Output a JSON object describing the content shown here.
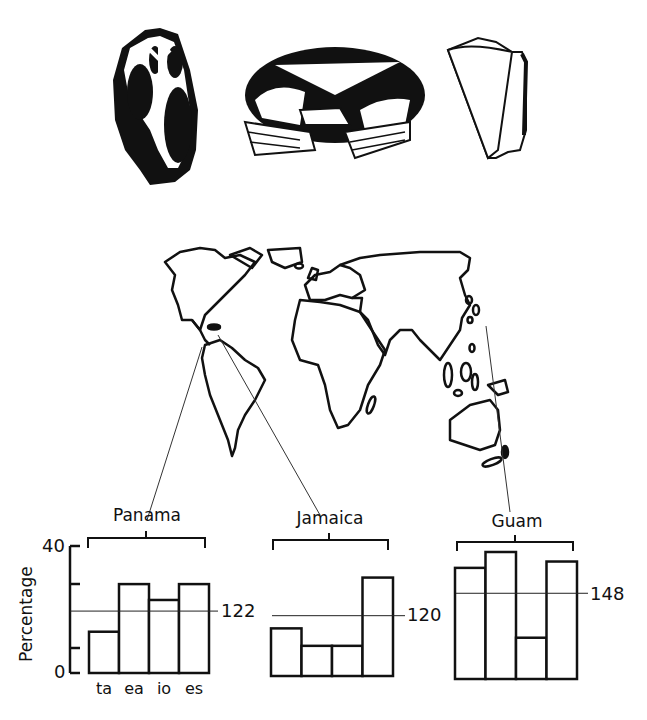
{
  "illustrations": [
    {
      "name": "shell-cross-section",
      "description": "sectioned gastropod shell"
    },
    {
      "name": "crab",
      "description": "crab (dorsal view)"
    },
    {
      "name": "cone-shell",
      "description": "cone shell"
    }
  ],
  "map": {
    "name": "world-map",
    "locations": [
      "Panama",
      "Jamaica",
      "Guam"
    ]
  },
  "axis": {
    "ylabel": "Percentage",
    "y_top": "40",
    "y_bottom": "0"
  },
  "categories": [
    "ta",
    "ea",
    "io",
    "es"
  ],
  "panels": [
    {
      "location": "Panama",
      "mean_label": "122"
    },
    {
      "location": "Jamaica",
      "mean_label": "120"
    },
    {
      "location": "Guam",
      "mean_label": "148"
    }
  ],
  "chart_data": {
    "type": "bar",
    "title": "",
    "xlabel": "",
    "ylabel": "Percentage",
    "ylim": [
      0,
      40
    ],
    "yticks": [
      0,
      10,
      20,
      30,
      40
    ],
    "ytick_labels": [
      "0",
      "",
      "",
      "",
      "40"
    ],
    "grid": false,
    "legend": "none",
    "categories": [
      "ta",
      "ea",
      "io",
      "es"
    ],
    "series": [
      {
        "name": "Panama",
        "values": [
          13,
          28,
          23,
          28
        ],
        "reference_line": 19.5,
        "reference_label": "122"
      },
      {
        "name": "Jamaica",
        "values": [
          15,
          9.5,
          9.5,
          31
        ],
        "reference_line": 19,
        "reference_label": "120"
      },
      {
        "name": "Guam",
        "values": [
          35,
          40,
          13,
          37
        ],
        "reference_line": 27,
        "reference_label": "148"
      }
    ],
    "annotations": [
      "Panama",
      "Jamaica",
      "Guam",
      "122",
      "120",
      "148"
    ]
  }
}
